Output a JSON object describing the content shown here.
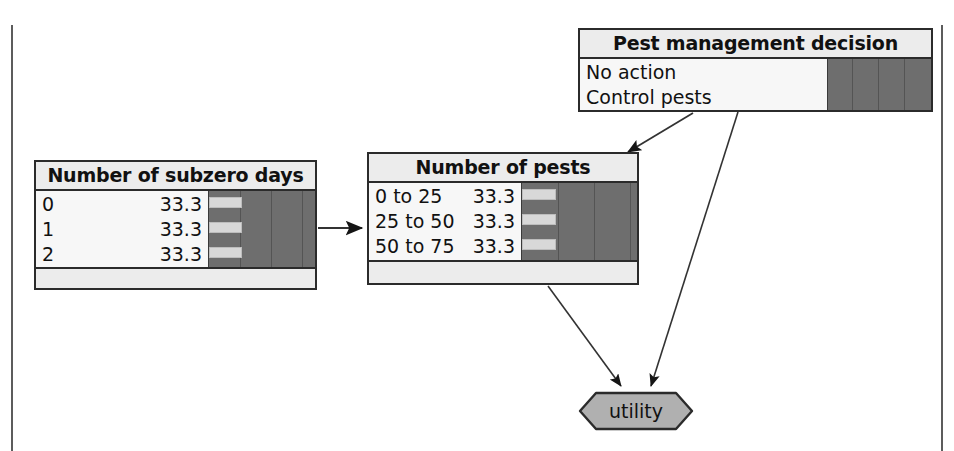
{
  "figure": {
    "type": "influence-diagram",
    "clipped_caption_fragment": "g y",
    "frame_color": "#5c5c5c",
    "node_border_color": "#2b2b2b",
    "node_title_bg": "#ececec",
    "node_body_bg": "#f7f7f7",
    "bar_track_color": "#6e6e6e",
    "bar_fill_color": "#d8d8d8",
    "utility_fill_color": "#b0b0b0"
  },
  "nodes": {
    "decision": {
      "id": "pest-management-decision",
      "kind": "decision",
      "title": "Pest management decision",
      "states": [
        {
          "label": "No action",
          "value": ""
        },
        {
          "label": "Control pests",
          "value": ""
        }
      ]
    },
    "subzero": {
      "id": "number-of-subzero-days",
      "kind": "chance",
      "title": "Number of subzero days",
      "states": [
        {
          "label": "0",
          "value": "33.3"
        },
        {
          "label": "1",
          "value": "33.3"
        },
        {
          "label": "2",
          "value": "33.3"
        }
      ]
    },
    "pests": {
      "id": "number-of-pests",
      "kind": "chance",
      "title": "Number of pests",
      "states": [
        {
          "label": "0 to 25",
          "value": "33.3"
        },
        {
          "label": "25 to 50",
          "value": "33.3"
        },
        {
          "label": "50 to 75",
          "value": "33.3"
        }
      ]
    },
    "utility": {
      "id": "utility",
      "kind": "utility",
      "title": "utility"
    }
  },
  "edges": [
    {
      "from": "number-of-subzero-days",
      "to": "number-of-pests"
    },
    {
      "from": "pest-management-decision",
      "to": "number-of-pests"
    },
    {
      "from": "pest-management-decision",
      "to": "utility"
    },
    {
      "from": "number-of-pests",
      "to": "utility"
    }
  ]
}
